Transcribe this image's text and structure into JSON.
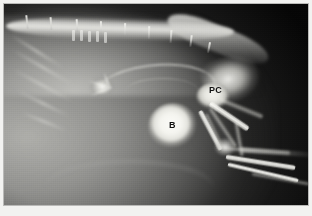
{
  "figure": {
    "type": "radiograph",
    "modality": "X-ray",
    "view": "lateral abdominal / pelvic projection",
    "frame": {
      "border_color": "#b9b9b7",
      "paper_color": "#f2f2f0",
      "plate_background": "#050505"
    }
  },
  "annotations": [
    {
      "id": "bladder",
      "label": "B",
      "meaning": "urinary bladder",
      "x": 165,
      "y": 117,
      "color": "#101010"
    },
    {
      "id": "prostate-colon",
      "label": "PC",
      "meaning": "prostate / colon",
      "x": 205,
      "y": 82,
      "color": "#101010"
    }
  ],
  "anatomy": {
    "spine": {
      "name": "lumbar vertebral column",
      "spinous_process_count": 9
    },
    "ribs": {
      "name": "ribs",
      "count": 5
    },
    "bladder": {
      "name": "urinary bladder",
      "appearance": "round radiopaque structure",
      "center_x": 169,
      "center_y": 122,
      "radius_x": 25,
      "radius_y": 23
    },
    "prostate_colon": {
      "name": "prostate / colon",
      "appearance": "oval opacity",
      "center_x": 209,
      "center_y": 92,
      "radius_x": 17,
      "radius_y": 13
    },
    "pelvis": {
      "name": "pelvis"
    },
    "hind_limb": {
      "name": "hind limb",
      "bones": [
        "femur",
        "tibia",
        "fibula",
        "tarsus",
        "metatarsals"
      ]
    },
    "mineral_opacity": {
      "name": "mineral opacity",
      "center_x": 98,
      "center_y": 83
    },
    "tail": {
      "name": "tail"
    }
  },
  "geometry": {
    "spinous_processes": [
      {
        "x": 22,
        "y": 11,
        "h": 14,
        "rot": -6
      },
      {
        "x": 46,
        "y": 13,
        "h": 13,
        "rot": -4
      },
      {
        "x": 72,
        "y": 15,
        "h": 13,
        "rot": -3
      },
      {
        "x": 96,
        "y": 17,
        "h": 13,
        "rot": -1
      },
      {
        "x": 120,
        "y": 19,
        "h": 13,
        "rot": 1
      },
      {
        "x": 144,
        "y": 22,
        "h": 13,
        "rot": 2
      },
      {
        "x": 166,
        "y": 26,
        "h": 13,
        "rot": 4
      },
      {
        "x": 186,
        "y": 31,
        "h": 12,
        "rot": 7
      },
      {
        "x": 204,
        "y": 38,
        "h": 11,
        "rot": 11
      }
    ],
    "vertebral_segments": [
      {
        "x": 68,
        "y": 26
      },
      {
        "x": 76,
        "y": 26
      },
      {
        "x": 84,
        "y": 27
      },
      {
        "x": 92,
        "y": 27
      },
      {
        "x": 100,
        "y": 28
      }
    ],
    "ribs": [
      {
        "x": 2,
        "y": 46,
        "w": 62,
        "rot": 32
      },
      {
        "x": 4,
        "y": 62,
        "w": 70,
        "rot": 30
      },
      {
        "x": 6,
        "y": 80,
        "w": 66,
        "rot": 28
      },
      {
        "x": 10,
        "y": 98,
        "w": 58,
        "rot": 26
      },
      {
        "x": 16,
        "y": 116,
        "w": 48,
        "rot": 22
      }
    ],
    "mineral_spurs": [
      {
        "x": 84,
        "y": 80,
        "w": 26,
        "rot": 18
      },
      {
        "x": 86,
        "y": 86,
        "w": 24,
        "rot": -22
      },
      {
        "x": 94,
        "y": 76,
        "w": 18,
        "rot": 70
      }
    ],
    "bones": [
      {
        "name": "femur-near",
        "x": 206,
        "y": 96,
        "w": 46,
        "h": 7,
        "rot": 34,
        "faint": false
      },
      {
        "name": "femur-far",
        "x": 214,
        "y": 92,
        "w": 48,
        "h": 6,
        "rot": 22,
        "faint": true
      },
      {
        "name": "tibia-near",
        "x": 196,
        "y": 104,
        "w": 44,
        "h": 6,
        "rot": 62,
        "faint": false
      },
      {
        "name": "tibia-far",
        "x": 206,
        "y": 102,
        "w": 46,
        "h": 5,
        "rot": 56,
        "faint": true
      },
      {
        "name": "fibula",
        "x": 202,
        "y": 108,
        "w": 40,
        "h": 4,
        "rot": 64,
        "faint": true
      },
      {
        "name": "metatarsus-1",
        "x": 222,
        "y": 150,
        "w": 70,
        "h": 6,
        "rot": 9,
        "faint": false
      },
      {
        "name": "metatarsus-2",
        "x": 224,
        "y": 158,
        "w": 72,
        "h": 5,
        "rot": 13,
        "faint": false
      },
      {
        "name": "metatarsus-3",
        "x": 220,
        "y": 142,
        "w": 66,
        "h": 5,
        "rot": 4,
        "faint": true
      },
      {
        "name": "digit-row",
        "x": 248,
        "y": 168,
        "w": 58,
        "h": 4,
        "rot": 10,
        "faint": true
      },
      {
        "name": "stifle-link",
        "x": 232,
        "y": 116,
        "w": 34,
        "h": 5,
        "rot": 80,
        "faint": true
      }
    ]
  }
}
